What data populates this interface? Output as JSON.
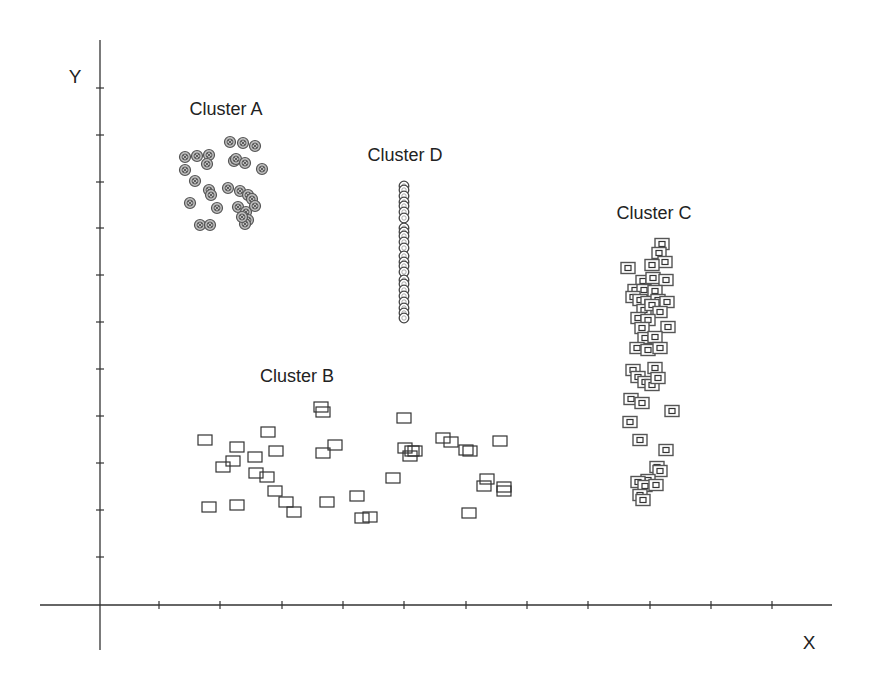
{
  "chart_data": {
    "type": "scatter",
    "title": "",
    "xlabel": "X",
    "ylabel": "Y",
    "grid": false,
    "legend": null,
    "axis_origin_px": {
      "x": 100,
      "y": 605
    },
    "x_ticks_px": [
      159,
      220,
      282,
      343,
      404,
      466,
      527,
      588,
      650,
      711,
      772
    ],
    "y_ticks_px": [
      88,
      135,
      182,
      228,
      275,
      322,
      369,
      416,
      463,
      510,
      557
    ],
    "x_range_ticks": [
      -1,
      12
    ],
    "y_range_ticks": [
      -1,
      12
    ],
    "annotations": [
      {
        "text": "Cluster A",
        "x": 226,
        "y": 115
      },
      {
        "text": "Cluster D",
        "x": 405,
        "y": 161
      },
      {
        "text": "Cluster C",
        "x": 654,
        "y": 219
      },
      {
        "text": "Cluster B",
        "x": 297,
        "y": 382
      }
    ],
    "series": [
      {
        "name": "Cluster A",
        "marker": "circle-with-cross",
        "color": "#555555",
        "points_px": [
          [
            185,
            157
          ],
          [
            197,
            156
          ],
          [
            209,
            155
          ],
          [
            207,
            164
          ],
          [
            185,
            170
          ],
          [
            195,
            181
          ],
          [
            230,
            142
          ],
          [
            243,
            143
          ],
          [
            255,
            146
          ],
          [
            234,
            161
          ],
          [
            236,
            159
          ],
          [
            245,
            163
          ],
          [
            262,
            169
          ],
          [
            209,
            190
          ],
          [
            211,
            195
          ],
          [
            228,
            188
          ],
          [
            240,
            191
          ],
          [
            248,
            195
          ],
          [
            252,
            199
          ],
          [
            190,
            203
          ],
          [
            217,
            208
          ],
          [
            238,
            207
          ],
          [
            246,
            212
          ],
          [
            255,
            206
          ],
          [
            200,
            225
          ],
          [
            210,
            225
          ],
          [
            248,
            220
          ],
          [
            245,
            224
          ],
          [
            242,
            217
          ]
        ]
      },
      {
        "name": "Cluster D",
        "marker": "circle-hollow",
        "color": "#444444",
        "points_px": [
          [
            404,
            186
          ],
          [
            404,
            190
          ],
          [
            404,
            196
          ],
          [
            404,
            202
          ],
          [
            404,
            206
          ],
          [
            404,
            212
          ],
          [
            404,
            218
          ],
          [
            404,
            228
          ],
          [
            404,
            232
          ],
          [
            404,
            236
          ],
          [
            404,
            242
          ],
          [
            404,
            248
          ],
          [
            404,
            256
          ],
          [
            404,
            262
          ],
          [
            404,
            266
          ],
          [
            404,
            272
          ],
          [
            404,
            280
          ],
          [
            404,
            284
          ],
          [
            404,
            290
          ],
          [
            404,
            296
          ],
          [
            404,
            302
          ],
          [
            404,
            308
          ],
          [
            404,
            313
          ],
          [
            404,
            318
          ]
        ]
      },
      {
        "name": "Cluster C",
        "marker": "square-double",
        "color": "#555555",
        "points_px": [
          [
            662,
            244
          ],
          [
            659,
            253
          ],
          [
            665,
            262
          ],
          [
            652,
            265
          ],
          [
            628,
            268
          ],
          [
            643,
            281
          ],
          [
            653,
            278
          ],
          [
            666,
            280
          ],
          [
            635,
            290
          ],
          [
            644,
            290
          ],
          [
            655,
            291
          ],
          [
            633,
            297
          ],
          [
            640,
            300
          ],
          [
            648,
            302
          ],
          [
            658,
            300
          ],
          [
            667,
            302
          ],
          [
            644,
            310
          ],
          [
            652,
            305
          ],
          [
            660,
            312
          ],
          [
            638,
            318
          ],
          [
            648,
            320
          ],
          [
            668,
            327
          ],
          [
            642,
            328
          ],
          [
            645,
            338
          ],
          [
            655,
            337
          ],
          [
            637,
            348
          ],
          [
            648,
            350
          ],
          [
            660,
            348
          ],
          [
            633,
            370
          ],
          [
            638,
            377
          ],
          [
            655,
            368
          ],
          [
            645,
            382
          ],
          [
            652,
            385
          ],
          [
            658,
            378
          ],
          [
            631,
            399
          ],
          [
            642,
            403
          ],
          [
            672,
            411
          ],
          [
            630,
            422
          ],
          [
            640,
            440
          ],
          [
            666,
            450
          ],
          [
            657,
            467
          ],
          [
            660,
            471
          ],
          [
            648,
            480
          ],
          [
            638,
            482
          ],
          [
            645,
            486
          ],
          [
            656,
            485
          ],
          [
            640,
            495
          ],
          [
            643,
            500
          ]
        ]
      },
      {
        "name": "Cluster B",
        "marker": "square-hollow",
        "color": "#333333",
        "points_px": [
          [
            205,
            440
          ],
          [
            223,
            467
          ],
          [
            233,
            461
          ],
          [
            237,
            447
          ],
          [
            268,
            432
          ],
          [
            255,
            457
          ],
          [
            276,
            451
          ],
          [
            256,
            473
          ],
          [
            267,
            477
          ],
          [
            275,
            491
          ],
          [
            286,
            502
          ],
          [
            294,
            512
          ],
          [
            209,
            507
          ],
          [
            237,
            505
          ],
          [
            321,
            407
          ],
          [
            323,
            412
          ],
          [
            323,
            453
          ],
          [
            335,
            445
          ],
          [
            327,
            502
          ],
          [
            357,
            496
          ],
          [
            362,
            518
          ],
          [
            370,
            517
          ],
          [
            393,
            478
          ],
          [
            404,
            418
          ],
          [
            405,
            448
          ],
          [
            410,
            456
          ],
          [
            412,
            451
          ],
          [
            415,
            451
          ],
          [
            443,
            438
          ],
          [
            451,
            442
          ],
          [
            466,
            450
          ],
          [
            470,
            451
          ],
          [
            500,
            441
          ],
          [
            487,
            479
          ],
          [
            484,
            486
          ],
          [
            504,
            487
          ],
          [
            504,
            491
          ],
          [
            469,
            513
          ]
        ]
      }
    ]
  }
}
